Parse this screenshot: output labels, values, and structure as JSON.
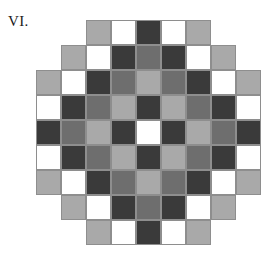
{
  "figure": {
    "label": "VI.",
    "shape": "octagon",
    "rows": 9,
    "cols": 9,
    "cell_size_px": 25
  },
  "palette": {
    "white": "#ffffff",
    "light_gray": "#a9a9a9",
    "mid_gray": "#6e6e6e",
    "dark": "#3a3a3a",
    "grid_line": "#8e8e8e",
    "background": "#ffffff",
    "text": "#1a1a1a"
  },
  "legend": [
    {
      "key": "W",
      "name": "white",
      "color": "#ffffff"
    },
    {
      "key": "L",
      "name": "light-gray",
      "color": "#a9a9a9"
    },
    {
      "key": "M",
      "name": "mid-gray",
      "color": "#6e6e6e"
    },
    {
      "key": "D",
      "name": "dark",
      "color": "#3a3a3a"
    },
    {
      "key": ".",
      "name": "empty",
      "color": "transparent"
    }
  ],
  "chart_data": {
    "type": "heatmap",
    "title": "VI.",
    "xlabel": "",
    "ylabel": "",
    "grid": true,
    "legend_position": "none",
    "x": [
      0,
      1,
      2,
      3,
      4,
      5,
      6,
      7,
      8
    ],
    "y": [
      0,
      1,
      2,
      3,
      4,
      5,
      6,
      7,
      8
    ],
    "categories": [
      "empty",
      "white",
      "light-gray",
      "mid-gray",
      "dark"
    ],
    "cells": [
      [
        ".",
        ".",
        "L",
        "W",
        "D",
        "W",
        "L",
        ".",
        "."
      ],
      [
        ".",
        "L",
        "W",
        "D",
        "M",
        "D",
        "W",
        "L",
        "."
      ],
      [
        "L",
        "W",
        "D",
        "M",
        "L",
        "M",
        "D",
        "W",
        "L"
      ],
      [
        "W",
        "D",
        "M",
        "L",
        "D",
        "L",
        "M",
        "D",
        "W"
      ],
      [
        "D",
        "M",
        "L",
        "D",
        "W",
        "D",
        "L",
        "M",
        "D"
      ],
      [
        "W",
        "D",
        "M",
        "L",
        "D",
        "L",
        "M",
        "D",
        "W"
      ],
      [
        "L",
        "W",
        "D",
        "M",
        "L",
        "M",
        "D",
        "W",
        "L"
      ],
      [
        ".",
        "L",
        "W",
        "D",
        "M",
        "D",
        "W",
        "L",
        "."
      ],
      [
        ".",
        ".",
        "L",
        "W",
        "D",
        "W",
        "L",
        ".",
        "."
      ]
    ]
  }
}
